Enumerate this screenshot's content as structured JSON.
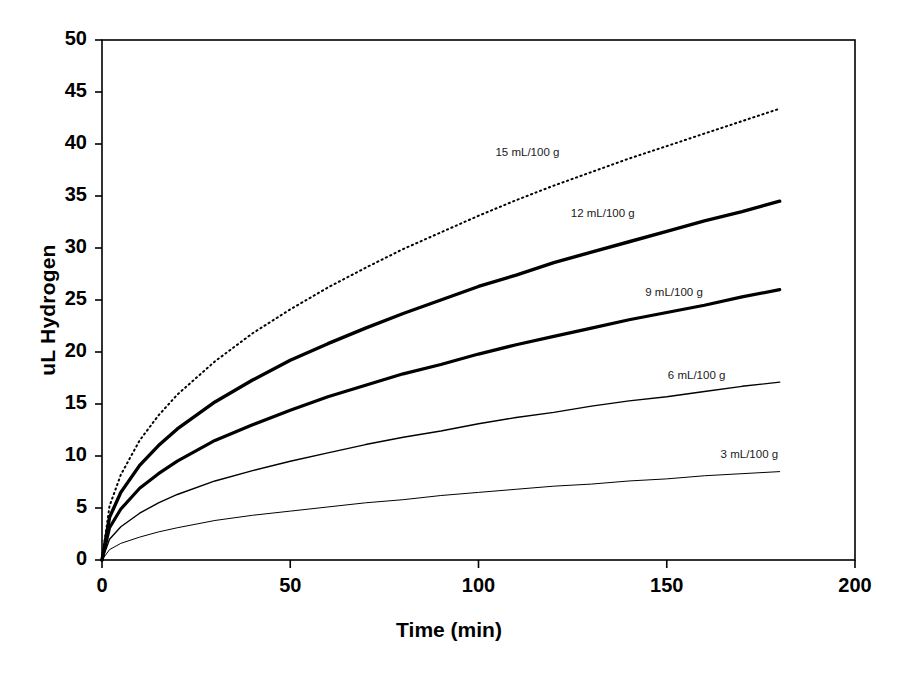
{
  "chart_data": {
    "type": "line",
    "title": "",
    "xlabel": "Time (min)",
    "ylabel": "uL Hydrogen",
    "xlim": [
      0,
      200
    ],
    "ylim": [
      0,
      50
    ],
    "xticks": [
      0,
      50,
      100,
      150,
      200
    ],
    "yticks": [
      0,
      5,
      10,
      15,
      20,
      25,
      30,
      35,
      40,
      45,
      50
    ],
    "grid": false,
    "legend_position": "inline-annotations",
    "x": [
      0,
      2,
      5,
      10,
      15,
      20,
      30,
      40,
      50,
      60,
      70,
      80,
      90,
      100,
      110,
      120,
      130,
      140,
      150,
      160,
      170,
      180
    ],
    "series": [
      {
        "name": "15 mL/100 g",
        "label": "15 mL/100 g",
        "style": "dotted",
        "line_width": 2,
        "color": "#000000",
        "values": [
          0,
          5.2,
          8.2,
          11.5,
          13.9,
          15.9,
          19.1,
          21.8,
          24.1,
          26.2,
          28.1,
          29.9,
          31.5,
          33.1,
          34.6,
          36.0,
          37.3,
          38.6,
          39.8,
          41.0,
          42.2,
          43.4
        ]
      },
      {
        "name": "12 mL/100 g",
        "label": "12 mL/100 g",
        "style": "solid",
        "line_width": 3.4,
        "color": "#000000",
        "values": [
          0,
          4.1,
          6.5,
          9.1,
          11.0,
          12.6,
          15.2,
          17.3,
          19.2,
          20.8,
          22.3,
          23.7,
          25.0,
          26.3,
          27.4,
          28.6,
          29.6,
          30.6,
          31.6,
          32.6,
          33.5,
          34.5
        ]
      },
      {
        "name": "9 mL/100 g",
        "label": "9 mL/100 g",
        "style": "solid",
        "line_width": 3.2,
        "color": "#000000",
        "values": [
          0,
          3.1,
          4.9,
          6.9,
          8.3,
          9.5,
          11.5,
          13.0,
          14.4,
          15.7,
          16.8,
          17.9,
          18.8,
          19.8,
          20.7,
          21.5,
          22.3,
          23.1,
          23.8,
          24.5,
          25.3,
          26.0
        ]
      },
      {
        "name": "6 mL/100 g",
        "label": "6 mL/100 g",
        "style": "solid",
        "line_width": 1.4,
        "color": "#000000",
        "values": [
          0,
          2.0,
          3.2,
          4.5,
          5.5,
          6.3,
          7.6,
          8.6,
          9.5,
          10.3,
          11.1,
          11.8,
          12.4,
          13.1,
          13.7,
          14.2,
          14.8,
          15.3,
          15.7,
          16.2,
          16.7,
          17.1
        ]
      },
      {
        "name": "3 mL/100 g",
        "label": "3 mL/100 g",
        "style": "solid",
        "line_width": 1.0,
        "color": "#000000",
        "values": [
          0,
          1.0,
          1.6,
          2.2,
          2.7,
          3.1,
          3.8,
          4.3,
          4.7,
          5.1,
          5.5,
          5.8,
          6.2,
          6.5,
          6.8,
          7.1,
          7.3,
          7.6,
          7.8,
          8.1,
          8.3,
          8.5
        ]
      }
    ],
    "annotations": [
      {
        "text": "15 mL/100 g",
        "x": 113,
        "y": 39.0
      },
      {
        "text": "12 mL/100 g",
        "x": 133,
        "y": 33.2
      },
      {
        "text": "9 mL/100 g",
        "x": 152,
        "y": 25.6
      },
      {
        "text": "6 mL/100 g",
        "x": 158,
        "y": 17.6
      },
      {
        "text": "3 mL/100 g",
        "x": 172,
        "y": 10.0
      }
    ]
  },
  "axis": {
    "y_title": "uL Hydrogen",
    "x_title": "Time (min)",
    "y_ticks": [
      "50",
      "45",
      "40",
      "35",
      "30",
      "25",
      "20",
      "15",
      "10",
      "5",
      "0"
    ],
    "x_ticks": [
      "0",
      "50",
      "100",
      "150",
      "200"
    ]
  },
  "colors": {
    "axis": "#000000",
    "plot_background": "#ffffff",
    "series": "#000000"
  }
}
